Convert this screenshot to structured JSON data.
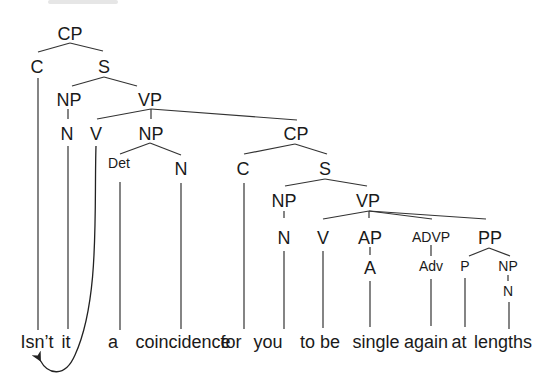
{
  "diagram": {
    "type": "syntax-tree",
    "colors": {
      "line": "#333333",
      "text": "#1a1a1a",
      "background": "#ffffff"
    },
    "nodes": [
      {
        "id": "cp1",
        "label": "CP",
        "x": 70,
        "y": 40
      },
      {
        "id": "c1",
        "label": "C",
        "x": 37,
        "y": 73
      },
      {
        "id": "s1",
        "label": "S",
        "x": 104,
        "y": 73
      },
      {
        "id": "np1",
        "label": "NP",
        "x": 69,
        "y": 106
      },
      {
        "id": "vp1",
        "label": "VP",
        "x": 150,
        "y": 106
      },
      {
        "id": "n1",
        "label": "N",
        "x": 66,
        "y": 140
      },
      {
        "id": "v1",
        "label": "V",
        "x": 96,
        "y": 140
      },
      {
        "id": "np2",
        "label": "NP",
        "x": 150,
        "y": 140
      },
      {
        "id": "cp2",
        "label": "CP",
        "x": 295,
        "y": 140
      },
      {
        "id": "det1",
        "label": "Det",
        "x": 119,
        "y": 168,
        "small": true
      },
      {
        "id": "n2",
        "label": "N",
        "x": 181,
        "y": 175
      },
      {
        "id": "c2",
        "label": "C",
        "x": 242,
        "y": 175
      },
      {
        "id": "s2",
        "label": "S",
        "x": 325,
        "y": 175
      },
      {
        "id": "np3",
        "label": "NP",
        "x": 284,
        "y": 207
      },
      {
        "id": "vp2",
        "label": "VP",
        "x": 368,
        "y": 207
      },
      {
        "id": "n3",
        "label": "N",
        "x": 284,
        "y": 244
      },
      {
        "id": "v2",
        "label": "V",
        "x": 323,
        "y": 244
      },
      {
        "id": "ap1",
        "label": "AP",
        "x": 370,
        "y": 244
      },
      {
        "id": "advp1",
        "label": "ADVP",
        "x": 431,
        "y": 242,
        "small": true
      },
      {
        "id": "pp1",
        "label": "PP",
        "x": 490,
        "y": 244
      },
      {
        "id": "a1",
        "label": "A",
        "x": 370,
        "y": 274
      },
      {
        "id": "adv1",
        "label": "Adv",
        "x": 431,
        "y": 271,
        "small": true
      },
      {
        "id": "p1",
        "label": "P",
        "x": 465,
        "y": 271,
        "small": true
      },
      {
        "id": "np4",
        "label": "NP",
        "x": 508,
        "y": 271,
        "small": true
      },
      {
        "id": "n4",
        "label": "N",
        "x": 508,
        "y": 295,
        "small": true
      }
    ],
    "words": [
      {
        "text": "Isn’t",
        "x": 37
      },
      {
        "text": "it",
        "x": 66
      },
      {
        "text": "a",
        "x": 113
      },
      {
        "text": "coincidence",
        "x": 183
      },
      {
        "text": "for",
        "x": 231
      },
      {
        "text": "you",
        "x": 268
      },
      {
        "text": "to be",
        "x": 320
      },
      {
        "text": "single",
        "x": 376
      },
      {
        "text": "again",
        "x": 426
      },
      {
        "text": "at",
        "x": 459
      },
      {
        "text": "lengths",
        "x": 503
      }
    ],
    "words_baseline_y": 348,
    "movement_arrow": {
      "from": "V",
      "to": "Isn’t"
    }
  }
}
